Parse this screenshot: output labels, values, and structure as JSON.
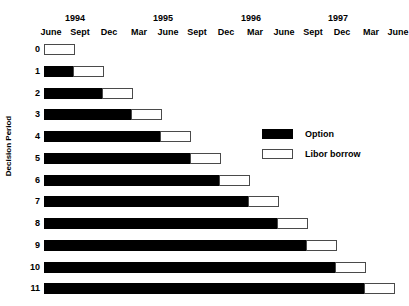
{
  "chart_data": {
    "type": "bar",
    "orientation": "horizontal",
    "subtype": "stacked-gantt",
    "title": "",
    "xlabel": "",
    "ylabel": "Decision Period",
    "x_axis": {
      "year_ticks": [
        {
          "label": "1994",
          "x": 75
        },
        {
          "label": "1995",
          "x": 163
        },
        {
          "label": "1996",
          "x": 251
        },
        {
          "label": "1997",
          "x": 338
        }
      ],
      "month_ticks": [
        {
          "label": "June",
          "x": 51
        },
        {
          "label": "Sept",
          "x": 80
        },
        {
          "label": "Dec",
          "x": 109
        },
        {
          "label": "Mar",
          "x": 139
        },
        {
          "label": "June",
          "x": 168
        },
        {
          "label": "Sept",
          "x": 197
        },
        {
          "label": "Dec",
          "x": 226
        },
        {
          "label": "Mar",
          "x": 255
        },
        {
          "label": "June",
          "x": 284
        },
        {
          "label": "Sept",
          "x": 313
        },
        {
          "label": "Dec",
          "x": 342
        },
        {
          "label": "Mar",
          "x": 371
        },
        {
          "label": "June",
          "x": 398
        }
      ],
      "quarter_width_px": 29.1,
      "origin_x_px": 44,
      "range_quarters": [
        0,
        12
      ]
    },
    "categories": [
      "0",
      "1",
      "2",
      "3",
      "4",
      "5",
      "6",
      "7",
      "8",
      "9",
      "10",
      "11"
    ],
    "series": [
      {
        "name": "Option",
        "color": "#000000",
        "values_quarters": [
          0,
          1,
          2,
          3,
          4,
          5,
          6,
          7,
          8,
          9,
          10,
          11
        ]
      },
      {
        "name": "Libor borrow",
        "color": "#ffffff",
        "values_quarters": [
          1,
          1,
          1,
          1,
          1,
          1,
          1,
          1,
          1,
          1,
          1,
          1
        ]
      }
    ],
    "rows": [
      {
        "label": "0",
        "option_start": 44,
        "option_width": 0,
        "libor_start": 44,
        "libor_width": 31,
        "y": 44
      },
      {
        "label": "1",
        "option_start": 44,
        "option_width": 29,
        "libor_start": 73,
        "libor_width": 31,
        "y": 66
      },
      {
        "label": "2",
        "option_start": 44,
        "option_width": 58,
        "libor_start": 102,
        "libor_width": 31,
        "y": 88
      },
      {
        "label": "3",
        "option_start": 44,
        "option_width": 87,
        "libor_start": 131,
        "libor_width": 31,
        "y": 109
      },
      {
        "label": "4",
        "option_start": 44,
        "option_width": 116,
        "libor_start": 160,
        "libor_width": 31,
        "y": 131
      },
      {
        "label": "5",
        "option_start": 44,
        "option_width": 146,
        "libor_start": 190,
        "libor_width": 31,
        "y": 153
      },
      {
        "label": "6",
        "option_start": 44,
        "option_width": 175,
        "libor_start": 219,
        "libor_width": 31,
        "y": 175
      },
      {
        "label": "7",
        "option_start": 44,
        "option_width": 204,
        "libor_start": 248,
        "libor_width": 31,
        "y": 196
      },
      {
        "label": "8",
        "option_start": 44,
        "option_width": 233,
        "libor_start": 277,
        "libor_width": 31,
        "y": 218
      },
      {
        "label": "9",
        "option_start": 44,
        "option_width": 262,
        "libor_start": 306,
        "libor_width": 31,
        "y": 240
      },
      {
        "label": "10",
        "option_start": 44,
        "option_width": 291,
        "libor_start": 335,
        "libor_width": 31,
        "y": 262
      },
      {
        "label": "11",
        "option_start": 44,
        "option_width": 320,
        "libor_start": 364,
        "libor_width": 31,
        "y": 283
      }
    ],
    "legend": {
      "position": "center-right",
      "entries": [
        {
          "label": "Option",
          "color": "#000000"
        },
        {
          "label": "Libor borrow",
          "color": "#ffffff"
        }
      ]
    },
    "grid": false
  },
  "axis": {
    "y_title": "Decision Period"
  },
  "legend": {
    "option_label": "Option",
    "libor_label": "Libor borrow"
  }
}
